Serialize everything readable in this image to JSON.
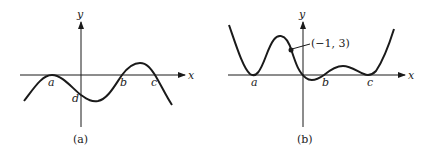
{
  "figures": [
    {
      "id": "a",
      "caption": "(a)",
      "axis_labels": {
        "x": "x",
        "y": "y"
      },
      "point_labels": [
        "a",
        "b",
        "c",
        "d"
      ]
    },
    {
      "id": "b",
      "caption": "(b)",
      "axis_labels": {
        "x": "x",
        "y": "y"
      },
      "point_labels": [
        "a",
        "b",
        "c"
      ],
      "annotation": "(−1, 3)"
    }
  ],
  "colors": {
    "stroke": "#1a1a1a",
    "background": "#ffffff"
  }
}
